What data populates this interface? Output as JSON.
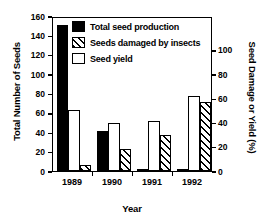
{
  "chart_data": {
    "type": "bar",
    "title": "",
    "xlabel": "Year",
    "ylabel": "Total Number of Seeds",
    "ylabel_right": "Seed Damage or Yield (%)",
    "categories": [
      "1989",
      "1990",
      "1991",
      "1992"
    ],
    "ylim": [
      0,
      160
    ],
    "ylim_right": [
      0,
      128
    ],
    "yticks": [
      "0",
      "20",
      "40",
      "60",
      "80",
      "100",
      "120",
      "140",
      "160"
    ],
    "yticks_right": [
      "0",
      "20",
      "40",
      "60",
      "80",
      "100"
    ],
    "grid": false,
    "legend_position": "top-center",
    "series": [
      {
        "name": "Total seed production",
        "style": "solid-black",
        "axis": "left",
        "units": "seeds",
        "values": [
          151,
          41,
          2,
          2
        ]
      },
      {
        "name": "Seeds damaged by insects",
        "style": "hatched",
        "axis": "right",
        "units": "%",
        "values": [
          5,
          18,
          30,
          57
        ]
      },
      {
        "name": "Seed yield",
        "style": "open-white",
        "axis": "right",
        "units": "%",
        "values": [
          50,
          40,
          41,
          62
        ]
      }
    ]
  },
  "colors": {
    "axis": "#000000",
    "bar_solid": "#000000",
    "bar_open": "#ffffff",
    "bar_hatch_line": "#000000",
    "background": "#ffffff"
  }
}
